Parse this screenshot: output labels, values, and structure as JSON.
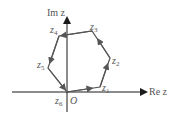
{
  "axes": {
    "x_label": "Re z",
    "y_label": "Im z",
    "origin_label": "O"
  },
  "vertices": [
    {
      "name": "z",
      "sub": "1"
    },
    {
      "name": "z",
      "sub": "2"
    },
    {
      "name": "z",
      "sub": "3"
    },
    {
      "name": "z",
      "sub": "4"
    },
    {
      "name": "z",
      "sub": "5"
    },
    {
      "name": "z",
      "sub": "6"
    }
  ],
  "colors": {
    "axis": "#1a1a1a",
    "polygon": "#555555"
  }
}
